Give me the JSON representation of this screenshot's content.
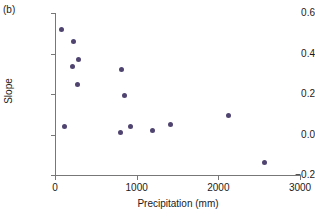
{
  "figure": {
    "panel_label": "(b)",
    "marker_color": "#4f4470",
    "axis_color": "#777777",
    "background": "#ffffff"
  },
  "chart_data": {
    "type": "scatter",
    "title": "",
    "xlabel": "Precipitation (mm)",
    "ylabel": "Slope",
    "xlim": [
      0,
      3000
    ],
    "ylim": [
      -0.2,
      0.6
    ],
    "xticks": [
      0,
      1000,
      2000,
      3000
    ],
    "xtick_labels": [
      "0",
      "1000",
      "2000",
      "3000"
    ],
    "yticks": [
      -0.2,
      0.0,
      0.2,
      0.4,
      0.6
    ],
    "ytick_labels": [
      "-0.2",
      "0.0",
      "0.2",
      "0.4",
      "0.6"
    ],
    "grid": false,
    "legend": null,
    "series": [
      {
        "name": "sites",
        "points": [
          {
            "x": 85,
            "y": 0.52
          },
          {
            "x": 120,
            "y": 0.04
          },
          {
            "x": 210,
            "y": 0.335
          },
          {
            "x": 230,
            "y": 0.46
          },
          {
            "x": 270,
            "y": 0.245
          },
          {
            "x": 290,
            "y": 0.37
          },
          {
            "x": 805,
            "y": 0.01
          },
          {
            "x": 820,
            "y": 0.32
          },
          {
            "x": 845,
            "y": 0.195
          },
          {
            "x": 920,
            "y": 0.04
          },
          {
            "x": 1190,
            "y": 0.02
          },
          {
            "x": 1410,
            "y": 0.05
          },
          {
            "x": 2120,
            "y": 0.095
          },
          {
            "x": 2570,
            "y": -0.14
          }
        ]
      }
    ]
  }
}
